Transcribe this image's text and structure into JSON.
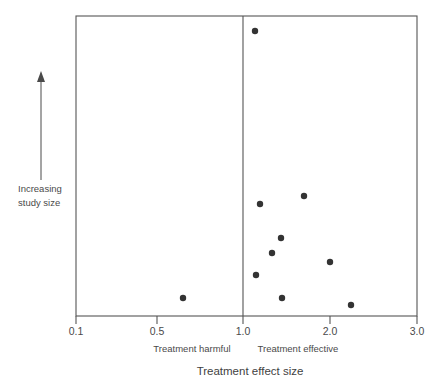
{
  "chart_data": {
    "type": "scatter",
    "title": "",
    "subtitle": "",
    "xlabel": "Treatment effect size",
    "ylabel": "Increasing study size",
    "xlim": [
      0.1,
      3.0
    ],
    "ylim": [
      0,
      1
    ],
    "grid": false,
    "legend": "none",
    "x_axis": {
      "scale": "custom-piecewise",
      "tick_labels": [
        "0.1",
        "0.5",
        "1.0",
        "2.0",
        "3.0"
      ],
      "tick_values": [
        0.1,
        0.5,
        1.0,
        2.0,
        3.0
      ],
      "tick_px": [
        76,
        157,
        243,
        330,
        417
      ]
    },
    "y_axis": {
      "tick_labels": [],
      "direction_arrow": "up",
      "caption_lines": [
        "Increasing",
        "study size"
      ]
    },
    "reference_line": {
      "name": "no-effect-line",
      "x_value": 1.0,
      "x_px": 243,
      "orientation": "vertical"
    },
    "region_labels": [
      {
        "text": "Treatment harmful",
        "side": "left",
        "center_px": 192
      },
      {
        "text": "Treatment effective",
        "side": "right",
        "center_px": 298
      }
    ],
    "points": [
      {
        "label": "study-1",
        "x": 1.06,
        "y": 0.95,
        "x_px": 255,
        "y_px": 31
      },
      {
        "label": "study-2",
        "x": 1.19,
        "y": 0.37,
        "x_px": 304,
        "y_px": 196
      },
      {
        "label": "study-3",
        "x": 1.2,
        "y": 0.34,
        "x_px": 260,
        "y_px": 204
      },
      {
        "label": "study-4",
        "x": 1.44,
        "y": 0.26,
        "x_px": 281,
        "y_px": 238
      },
      {
        "label": "study-5",
        "x": 1.34,
        "y": 0.21,
        "x_px": 272,
        "y_px": 253
      },
      {
        "label": "study-6",
        "x": 2.0,
        "y": 0.18,
        "x_px": 330,
        "y_px": 262
      },
      {
        "label": "study-7",
        "x": 1.15,
        "y": 0.14,
        "x_px": 256,
        "y_px": 275
      },
      {
        "label": "study-8",
        "x": 0.68,
        "y": 0.06,
        "x_px": 183,
        "y_px": 298
      },
      {
        "label": "study-9",
        "x": 1.45,
        "y": 0.06,
        "x_px": 282,
        "y_px": 298
      },
      {
        "label": "study-10",
        "x": 2.24,
        "y": 0.04,
        "x_px": 351,
        "y_px": 305
      }
    ],
    "plot_area_px": {
      "left": 76,
      "right": 417,
      "top": 16,
      "bottom": 316
    },
    "colors": {
      "point": "#333333",
      "axis": "#555555",
      "text": "#4a4a4a",
      "background": "#ffffff"
    }
  }
}
